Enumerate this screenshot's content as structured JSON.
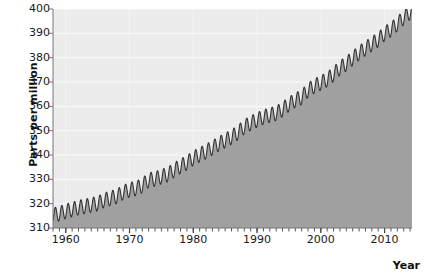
{
  "chart_data": {
    "type": "area",
    "title": "",
    "subtitle": "",
    "xlabel": "Year",
    "ylabel": "Parts per million",
    "xlim": [
      1958,
      2014.3
    ],
    "ylim": [
      310,
      400
    ],
    "y_ticks": [
      310,
      320,
      330,
      340,
      350,
      360,
      370,
      380,
      390,
      400
    ],
    "x_ticks": [
      1960,
      1970,
      1980,
      1990,
      2000,
      2010
    ],
    "x_minor_tick_interval": 1,
    "grid": "horizontal-white-major, vertical-faint-at-decades",
    "legend": "none",
    "annotations": [],
    "series": [
      {
        "name": "Atmospheric CO2 concentration",
        "line_color": "#333333",
        "fill_color": "#a0a0a0",
        "seasonal_amplitude_ppm": 3.0,
        "seasonal_period_years": 1,
        "x": [
          1958,
          1959,
          1960,
          1961,
          1962,
          1963,
          1964,
          1965,
          1966,
          1967,
          1968,
          1969,
          1970,
          1971,
          1972,
          1973,
          1974,
          1975,
          1976,
          1977,
          1978,
          1979,
          1980,
          1981,
          1982,
          1983,
          1984,
          1985,
          1986,
          1987,
          1988,
          1989,
          1990,
          1991,
          1992,
          1993,
          1994,
          1995,
          1996,
          1997,
          1998,
          1999,
          2000,
          2001,
          2002,
          2003,
          2004,
          2005,
          2006,
          2007,
          2008,
          2009,
          2010,
          2011,
          2012,
          2013,
          2014
        ],
        "values": [
          315.3,
          315.9,
          316.9,
          317.6,
          318.4,
          318.9,
          319.5,
          320.0,
          321.4,
          322.2,
          323.0,
          324.6,
          325.7,
          326.3,
          327.5,
          329.7,
          330.2,
          331.1,
          332.0,
          333.8,
          335.4,
          336.8,
          338.7,
          340.1,
          341.4,
          343.0,
          344.6,
          346.0,
          347.4,
          349.2,
          351.6,
          353.1,
          354.4,
          355.6,
          356.4,
          357.1,
          358.8,
          360.8,
          362.6,
          363.7,
          366.7,
          368.4,
          369.6,
          371.1,
          373.2,
          375.8,
          377.5,
          379.8,
          381.9,
          383.8,
          385.6,
          387.4,
          389.9,
          391.6,
          393.8,
          396.5,
          398.6
        ]
      }
    ]
  },
  "axis": {
    "y_label_text": "Parts per million",
    "x_label_text": "Year",
    "y_tick_labels": [
      "400",
      "390",
      "380",
      "370",
      "360",
      "350",
      "340",
      "330",
      "320",
      "310"
    ],
    "x_tick_labels": [
      "1960",
      "1970",
      "1980",
      "1990",
      "2000",
      "2010"
    ]
  },
  "colors": {
    "plot_background": "#ececec",
    "gridline": "#ffffff",
    "area_fill": "#a0a0a0",
    "data_line": "#333333",
    "axis_line": "#777777",
    "text": "#1a1a1a"
  }
}
